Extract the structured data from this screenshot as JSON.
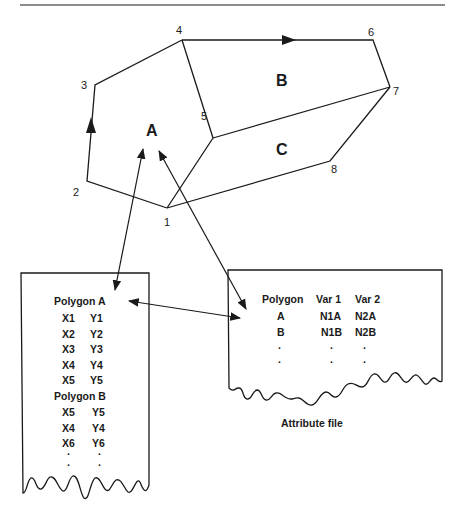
{
  "figure": {
    "polygons": {
      "A": {
        "label": "A"
      },
      "B": {
        "label": "B"
      },
      "C": {
        "label": "C"
      }
    },
    "vertices": [
      {
        "id": "1",
        "label": "1"
      },
      {
        "id": "2",
        "label": "2"
      },
      {
        "id": "3",
        "label": "3"
      },
      {
        "id": "4",
        "label": "4"
      },
      {
        "id": "5",
        "label": "5"
      },
      {
        "id": "6",
        "label": "6"
      },
      {
        "id": "7",
        "label": "7"
      },
      {
        "id": "8",
        "label": "8"
      }
    ]
  },
  "coordinate_file": {
    "rows": [
      {
        "c1": "Polygon  A",
        "c2": ""
      },
      {
        "c1": "X1",
        "c2": "Y1"
      },
      {
        "c1": "X2",
        "c2": "Y2"
      },
      {
        "c1": "X3",
        "c2": "Y3"
      },
      {
        "c1": "X4",
        "c2": "Y4"
      },
      {
        "c1": "X5",
        "c2": "Y5"
      },
      {
        "c1": "Polygon  B",
        "c2": ""
      },
      {
        "c1": "X5",
        "c2": "Y5"
      },
      {
        "c1": "X4",
        "c2": "Y4"
      },
      {
        "c1": "X6",
        "c2": "Y6"
      },
      {
        "c1": "·",
        "c2": "·"
      },
      {
        "c1": "·",
        "c2": "·"
      }
    ]
  },
  "attribute_file": {
    "caption": "Attribute file",
    "headers": [
      "Polygon",
      "Var 1",
      "Var 2"
    ],
    "rows": [
      [
        "A",
        "N1A",
        "N2A"
      ],
      [
        "B",
        "N1B",
        "N2B"
      ],
      [
        "·",
        "·",
        "·"
      ],
      [
        "·",
        "·",
        "·"
      ]
    ]
  }
}
